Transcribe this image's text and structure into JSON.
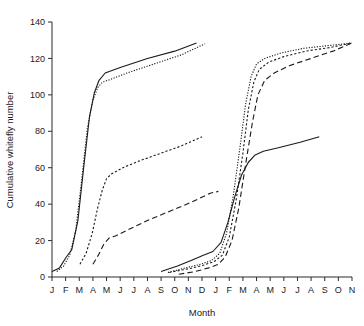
{
  "chart_data": {
    "type": "line",
    "title": "",
    "xlabel": "Month",
    "ylabel": "Cumulative whitefly number",
    "xlim": [
      0,
      22
    ],
    "ylim": [
      0,
      140
    ],
    "yticks": [
      0,
      20,
      40,
      60,
      80,
      100,
      120,
      140
    ],
    "xticks": [
      "J",
      "F",
      "M",
      "A",
      "M",
      "J",
      "J",
      "A",
      "S",
      "O",
      "N",
      "D",
      "J",
      "F",
      "M",
      "A",
      "M",
      "J",
      "J",
      "A",
      "S",
      "O",
      "N"
    ],
    "grid": false,
    "legend": "none",
    "series": [
      {
        "name": "season1-solid",
        "style": "solid",
        "points": [
          [
            0,
            3
          ],
          [
            0.55,
            5
          ],
          [
            1.05,
            11
          ],
          [
            1.45,
            15
          ],
          [
            1.9,
            31
          ],
          [
            2.35,
            62
          ],
          [
            2.75,
            88
          ],
          [
            3.1,
            101
          ],
          [
            3.45,
            108
          ],
          [
            3.9,
            112
          ],
          [
            5.0,
            115
          ],
          [
            7.0,
            120
          ],
          [
            9.0,
            124
          ],
          [
            10.6,
            128.5
          ]
        ]
      },
      {
        "name": "season1-dotted",
        "style": "dotted",
        "points": [
          [
            0.35,
            3
          ],
          [
            0.85,
            6
          ],
          [
            1.3,
            12
          ],
          [
            1.75,
            26
          ],
          [
            2.2,
            55
          ],
          [
            2.6,
            82
          ],
          [
            3.0,
            97
          ],
          [
            3.35,
            104
          ],
          [
            3.7,
            107
          ],
          [
            4.3,
            108.5
          ],
          [
            5.5,
            112
          ],
          [
            7.5,
            117
          ],
          [
            9.5,
            122
          ],
          [
            11.2,
            128
          ]
        ]
      },
      {
        "name": "season1-finedot",
        "style": "finedot",
        "points": [
          [
            2.05,
            7
          ],
          [
            2.5,
            13
          ],
          [
            2.95,
            24
          ],
          [
            3.35,
            38
          ],
          [
            3.7,
            48
          ],
          [
            4.0,
            54
          ],
          [
            4.35,
            56.5
          ],
          [
            5.2,
            60
          ],
          [
            6.5,
            64
          ],
          [
            8.0,
            68
          ],
          [
            9.5,
            72
          ],
          [
            11.0,
            77
          ]
        ]
      },
      {
        "name": "season1-dashed",
        "style": "dashed",
        "points": [
          [
            3.0,
            7
          ],
          [
            3.4,
            12
          ],
          [
            3.8,
            18
          ],
          [
            4.2,
            21.5
          ],
          [
            4.65,
            22.5
          ],
          [
            5.6,
            26
          ],
          [
            7.0,
            31
          ],
          [
            8.6,
            36
          ],
          [
            10.2,
            41
          ],
          [
            11.6,
            46
          ],
          [
            12.2,
            47
          ]
        ]
      },
      {
        "name": "season2-solid",
        "style": "solid",
        "points": [
          [
            8.0,
            3
          ],
          [
            9.2,
            6
          ],
          [
            10.2,
            9
          ],
          [
            11.1,
            12
          ],
          [
            11.8,
            14
          ],
          [
            12.4,
            19
          ],
          [
            12.9,
            30
          ],
          [
            13.4,
            44
          ],
          [
            13.9,
            56
          ],
          [
            14.4,
            63
          ],
          [
            14.9,
            67
          ],
          [
            15.5,
            69
          ],
          [
            16.6,
            71
          ],
          [
            18.2,
            74
          ],
          [
            19.6,
            77
          ]
        ]
      },
      {
        "name": "season2-dotted",
        "style": "dotted",
        "points": [
          [
            8.5,
            2.5
          ],
          [
            9.8,
            5
          ],
          [
            10.9,
            7
          ],
          [
            11.7,
            9
          ],
          [
            12.3,
            13
          ],
          [
            12.8,
            24
          ],
          [
            13.3,
            45
          ],
          [
            13.8,
            72
          ],
          [
            14.2,
            95
          ],
          [
            14.6,
            110
          ],
          [
            15.0,
            117
          ],
          [
            15.6,
            120
          ],
          [
            16.8,
            123
          ],
          [
            18.4,
            125.5
          ],
          [
            20.2,
            127
          ],
          [
            22.0,
            128.5
          ]
        ]
      },
      {
        "name": "season2-finedot",
        "style": "finedot",
        "points": [
          [
            8.6,
            2.5
          ],
          [
            10.0,
            4.5
          ],
          [
            11.1,
            6.5
          ],
          [
            11.9,
            8.5
          ],
          [
            12.5,
            12
          ],
          [
            13.0,
            22
          ],
          [
            13.5,
            42
          ],
          [
            14.0,
            68
          ],
          [
            14.4,
            92
          ],
          [
            14.8,
            107
          ],
          [
            15.2,
            114
          ],
          [
            15.9,
            118
          ],
          [
            17.0,
            121
          ],
          [
            18.6,
            124
          ],
          [
            20.4,
            126
          ],
          [
            22.0,
            128.5
          ]
        ]
      },
      {
        "name": "season2-dashed",
        "style": "dashed",
        "points": [
          [
            9.3,
            1.5
          ],
          [
            10.5,
            3
          ],
          [
            11.5,
            5
          ],
          [
            12.2,
            7
          ],
          [
            12.7,
            11
          ],
          [
            13.2,
            20
          ],
          [
            13.7,
            38
          ],
          [
            14.2,
            62
          ],
          [
            14.7,
            85
          ],
          [
            15.1,
            100
          ],
          [
            15.6,
            108
          ],
          [
            16.3,
            112
          ],
          [
            17.4,
            116
          ],
          [
            19.0,
            120
          ],
          [
            20.6,
            124
          ],
          [
            22.0,
            128.5
          ]
        ]
      }
    ]
  }
}
